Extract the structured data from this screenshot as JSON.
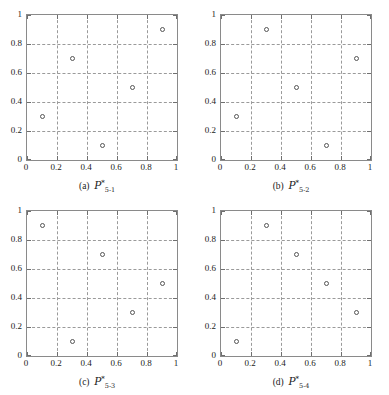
{
  "figure": {
    "background": "#ffffff",
    "axis_color": "#8a8a8a",
    "grid_color": "#9a9a9a",
    "marker_color": "#555555"
  },
  "axis": {
    "xticks": [
      "0",
      "0.2",
      "0.4",
      "0.6",
      "0.8",
      "1"
    ],
    "xtick_values": [
      0,
      0.2,
      0.4,
      0.6,
      0.8,
      1
    ],
    "yticks": [
      "0",
      "0.2",
      "0.4",
      "0.6",
      "0.8",
      "1"
    ],
    "ytick_values": [
      0,
      0.2,
      0.4,
      0.6,
      0.8,
      1
    ],
    "gridlines": [
      0.2,
      0.4,
      0.6,
      0.8
    ],
    "xlim": [
      0,
      1
    ],
    "ylim": [
      0,
      1
    ]
  },
  "captions": {
    "a": {
      "index": "(a)",
      "symbol": "P",
      "star": "*",
      "sub": "5-1"
    },
    "b": {
      "index": "(b)",
      "symbol": "P",
      "star": "*",
      "sub": "5-2"
    },
    "c": {
      "index": "(c)",
      "symbol": "P",
      "star": "*",
      "sub": "5-3"
    },
    "d": {
      "index": "(d)",
      "symbol": "P",
      "star": "*",
      "sub": "5-4"
    }
  },
  "chart_data": [
    {
      "type": "scatter",
      "title": "(a) P*_5-1",
      "xlabel": "",
      "ylabel": "",
      "xlim": [
        0,
        1
      ],
      "ylim": [
        0,
        1
      ],
      "grid": true,
      "marker": "open-circle",
      "x": [
        0.1,
        0.3,
        0.5,
        0.7,
        0.9
      ],
      "y": [
        0.3,
        0.7,
        0.1,
        0.5,
        0.9
      ]
    },
    {
      "type": "scatter",
      "title": "(b) P*_5-2",
      "xlabel": "",
      "ylabel": "",
      "xlim": [
        0,
        1
      ],
      "ylim": [
        0,
        1
      ],
      "grid": true,
      "marker": "open-circle",
      "x": [
        0.1,
        0.3,
        0.5,
        0.7,
        0.9
      ],
      "y": [
        0.3,
        0.9,
        0.5,
        0.1,
        0.7
      ]
    },
    {
      "type": "scatter",
      "title": "(c) P*_5-3",
      "xlabel": "",
      "ylabel": "",
      "xlim": [
        0,
        1
      ],
      "ylim": [
        0,
        1
      ],
      "grid": true,
      "marker": "open-circle",
      "x": [
        0.1,
        0.3,
        0.5,
        0.7,
        0.9
      ],
      "y": [
        0.9,
        0.1,
        0.7,
        0.3,
        0.5
      ]
    },
    {
      "type": "scatter",
      "title": "(d) P*_5-4",
      "xlabel": "",
      "ylabel": "",
      "xlim": [
        0,
        1
      ],
      "ylim": [
        0,
        1
      ],
      "grid": true,
      "marker": "open-circle",
      "x": [
        0.1,
        0.3,
        0.5,
        0.7,
        0.9
      ],
      "y": [
        0.1,
        0.9,
        0.7,
        0.5,
        0.3
      ]
    }
  ]
}
